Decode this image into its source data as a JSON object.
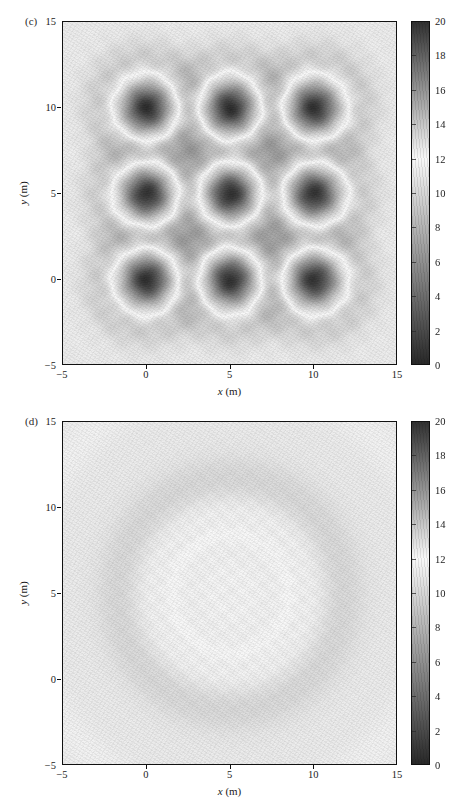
{
  "figure": {
    "type": "contour-map-pair",
    "panels": [
      {
        "id": "c",
        "label": "(c)",
        "xlabel_italic": "x",
        "xlabel_unit": " (m)",
        "ylabel_italic": "y",
        "ylabel_unit": " (m)",
        "xticks": [
          "−5",
          "0",
          "5",
          "10",
          "15"
        ],
        "yticks": [
          "15",
          "10",
          "5",
          "0",
          "−5"
        ],
        "xlim": [
          -5,
          15
        ],
        "ylim": [
          -5,
          15
        ],
        "colorbar": {
          "ticks": [
            "20",
            "18",
            "16",
            "14",
            "12",
            "10",
            "8",
            "6",
            "4",
            "2",
            "0"
          ],
          "vmin": 0,
          "vmax": 20
        }
      },
      {
        "id": "d",
        "label": "(d)",
        "xlabel_italic": "x",
        "xlabel_unit": " (m)",
        "ylabel_italic": "y",
        "ylabel_unit": " (m)",
        "xticks": [
          "−5",
          "0",
          "5",
          "10",
          "15"
        ],
        "yticks": [
          "15",
          "10",
          "5",
          "0",
          "−5"
        ],
        "xlim": [
          -5,
          15
        ],
        "ylim": [
          -5,
          15
        ],
        "colorbar": {
          "ticks": [
            "20",
            "18",
            "16",
            "14",
            "12",
            "10",
            "8",
            "6",
            "4",
            "2",
            "0"
          ],
          "vmin": 0,
          "vmax": 20
        }
      }
    ]
  },
  "chart_data": [
    {
      "type": "heatmap",
      "panel": "(c)",
      "title": "",
      "xlabel": "x (m)",
      "ylabel": "y (m)",
      "xlim": [
        -5,
        15
      ],
      "ylim": [
        -5,
        15
      ],
      "zlim": [
        0,
        20
      ],
      "colormap": "grayscale-diverging (dark at 0 and 20, lightest near 12)",
      "grid": false,
      "legend": "colorbar-right",
      "colorbar_ticks": [
        0,
        2,
        4,
        6,
        8,
        10,
        12,
        14,
        16,
        18,
        20
      ],
      "xticks": [
        -5,
        0,
        5,
        10,
        15
      ],
      "yticks": [
        -5,
        0,
        5,
        10,
        15
      ],
      "description": "Nine localized dark minima arranged on a 3x3 grid, each surrounded by a bright ring halo; uniform mid-gray background outside the grid region.",
      "features": {
        "background_value": 12.5,
        "minimum_value": 3.0,
        "halo_value": 13.8,
        "source_grid": {
          "x_positions": [
            0,
            5,
            10
          ],
          "y_positions": [
            0,
            5,
            10
          ],
          "core_radius_m": 0.9,
          "halo_radius_m": 2.6
        },
        "points": [
          {
            "x": 0,
            "y": 10,
            "value": 3.0
          },
          {
            "x": 5,
            "y": 10,
            "value": 3.0
          },
          {
            "x": 10,
            "y": 10,
            "value": 3.2
          },
          {
            "x": 0,
            "y": 5,
            "value": 3.1
          },
          {
            "x": 5,
            "y": 5,
            "value": 3.0
          },
          {
            "x": 10,
            "y": 5,
            "value": 3.2
          },
          {
            "x": 0,
            "y": 0,
            "value": 3.0
          },
          {
            "x": 5,
            "y": 0,
            "value": 3.1
          },
          {
            "x": 10,
            "y": 0,
            "value": 3.2
          }
        ]
      }
    },
    {
      "type": "heatmap",
      "panel": "(d)",
      "title": "",
      "xlabel": "x (m)",
      "ylabel": "y (m)",
      "xlim": [
        -5,
        15
      ],
      "ylim": [
        -5,
        15
      ],
      "zlim": [
        0,
        20
      ],
      "colormap": "grayscale-diverging (dark at 0 and 20, lightest near 12)",
      "grid": false,
      "legend": "colorbar-right",
      "colorbar_ticks": [
        0,
        2,
        4,
        6,
        8,
        10,
        12,
        14,
        16,
        18,
        20
      ],
      "xticks": [
        -5,
        0,
        5,
        10,
        15
      ],
      "yticks": [
        -5,
        0,
        5,
        10,
        15
      ],
      "description": "Smooth broad radially-symmetric pattern of faint concentric rings centred near x=5, y=5; slightly darker disc in the centre, brighter annulus at radius ~6 m, returning to mid-gray at the edges.",
      "features": {
        "center": {
          "x": 5,
          "y": 5
        },
        "center_value": 11.6,
        "ring_bright_radius_m": 6.5,
        "ring_bright_value": 13.2,
        "background_value": 12.4,
        "radial_profile": [
          {
            "radius_m": 0,
            "value": 11.6
          },
          {
            "radius_m": 2.5,
            "value": 11.7
          },
          {
            "radius_m": 4.5,
            "value": 12.2
          },
          {
            "radius_m": 6.5,
            "value": 13.2
          },
          {
            "radius_m": 8.5,
            "value": 12.7
          },
          {
            "radius_m": 11,
            "value": 12.4
          },
          {
            "radius_m": 14,
            "value": 12.3
          }
        ]
      }
    }
  ]
}
